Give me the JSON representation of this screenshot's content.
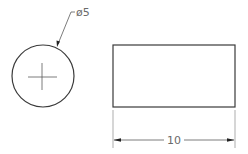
{
  "drawing": {
    "type": "engineering-drawing",
    "colors": {
      "outline": "#3a3a3a",
      "dimension": "#5a5a5a",
      "extension": "#8a8a8a",
      "text": "#6a6a6a",
      "background": "#ffffff"
    },
    "views": {
      "end_view": {
        "shape": "circle",
        "center_mark": true,
        "diameter_label": "ø5"
      },
      "side_view": {
        "shape": "rectangle",
        "length_label": "10"
      }
    }
  }
}
